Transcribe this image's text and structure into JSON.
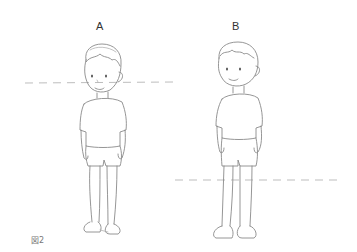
{
  "figure": {
    "caption": "図2",
    "panels": [
      {
        "label": "A",
        "guide_line": "dashed horizontal line at eye level"
      },
      {
        "label": "B",
        "guide_line": "dashed horizontal line at knee level"
      }
    ]
  }
}
